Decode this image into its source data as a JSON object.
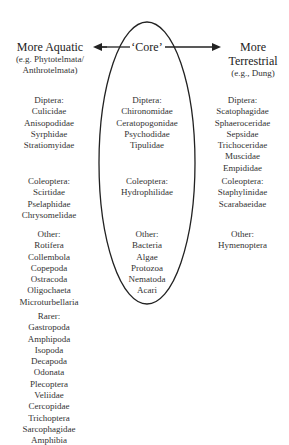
{
  "headers": {
    "left": {
      "title": "More Aquatic",
      "subtitle_lines": [
        "(e.g. Phytotelmata/",
        "Anthrotelmata)"
      ]
    },
    "center": {
      "title": "‘Core’"
    },
    "right": {
      "title_lines": [
        "More",
        "Terrestrial"
      ],
      "subtitle": "(e.g., Dung)"
    }
  },
  "left_groups": [
    {
      "label": "Diptera:",
      "items": [
        "Culicidae",
        "Anisopodidae",
        "Syrphidae",
        "Stratiomyidae"
      ]
    },
    {
      "label": "Coleoptera:",
      "items": [
        "Scirtidae",
        "Pselaphidae",
        "Chrysomelidae"
      ]
    },
    {
      "label": "Other:",
      "items": [
        "Rotifera",
        "Collembola",
        "Copepoda",
        "Ostracoda",
        "Oligochaeta",
        "Microturbellaria"
      ]
    },
    {
      "label": "Rarer:",
      "items": [
        "Gastropoda",
        "Amphipoda",
        "Isopoda",
        "Decapoda",
        "Odonata",
        "Plecoptera",
        "Veliidae",
        "Cercopidae",
        "Trichoptera",
        "Sarcophagidae",
        "Amphibia"
      ]
    }
  ],
  "center_groups": [
    {
      "label": "Diptera:",
      "items": [
        "Chironomidae",
        "Ceratopogonidae",
        "Psychodidae",
        "Tipulidae"
      ]
    },
    {
      "label": "Coleoptera:",
      "items": [
        "Hydrophilidae"
      ]
    },
    {
      "label": "Other:",
      "items": [
        "Bacteria",
        "Algae",
        "Protozoa",
        "Nematoda",
        "Acari"
      ]
    }
  ],
  "right_groups": [
    {
      "label": "Diptera:",
      "items": [
        "Scatophagidae",
        "Sphaeroceridae",
        "Sepsidae",
        "Trichoceridae",
        "Muscidae",
        "Empididae"
      ]
    },
    {
      "label": "Coleoptera:",
      "items": [
        "Staphylinidae",
        "Scarabaeidae"
      ]
    },
    {
      "label": "Other:",
      "items": [
        "Hymenoptera"
      ]
    }
  ],
  "colors": {
    "line": "#222222",
    "text": "#333333",
    "background": "#ffffff"
  }
}
